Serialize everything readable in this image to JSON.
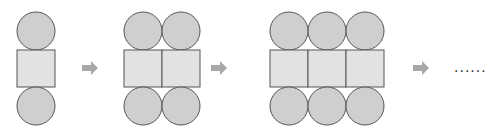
{
  "diagram": {
    "steps": [
      {
        "columns": 1,
        "x": 17
      },
      {
        "columns": 2,
        "x": 124
      },
      {
        "columns": 3,
        "x": 270
      }
    ],
    "cell_size": 38,
    "continuation": "......",
    "colors": {
      "circle_fill": "#cfcfcf",
      "square_fill": "#e2e2e2",
      "stroke": "#555555",
      "arrow": "#a8a8a8"
    }
  }
}
